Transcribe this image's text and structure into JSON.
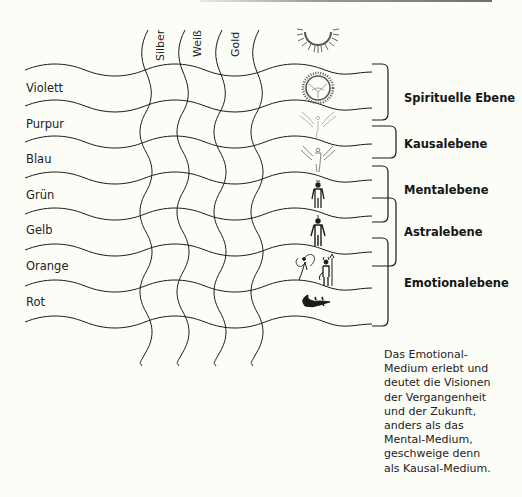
{
  "diagram": {
    "columns": [
      {
        "label": "Silber"
      },
      {
        "label": "Weiß"
      },
      {
        "label": "Gold"
      }
    ],
    "rows": [
      {
        "label": "Violett",
        "icon": "radiant-sun-with-dove-icon"
      },
      {
        "label": "Purpur",
        "icon": "winged-angel-faint-icon"
      },
      {
        "label": "Blau",
        "icon": "winged-angel-figure-icon"
      },
      {
        "label": "Grün",
        "icon": "human-figure-with-halo-icon"
      },
      {
        "label": "Gelb",
        "icon": "human-figure-icon"
      },
      {
        "label": "Orange",
        "icon": "fairy-and-devil-figures-icon"
      },
      {
        "label": "Rot",
        "icon": "lizard-icon"
      }
    ],
    "top_icon": "radiant-half-sun-icon",
    "planes": [
      {
        "label": "Spirituelle Ebene",
        "spans_rows": [
          "Violett",
          "Purpur"
        ]
      },
      {
        "label": "Kausalebene",
        "spans_rows": [
          "Blau"
        ]
      },
      {
        "label": "Mentalebene",
        "spans_rows": [
          "Grün",
          "Gelb"
        ]
      },
      {
        "label": "Astralebene",
        "spans_rows": [
          "Gelb",
          "Orange"
        ]
      },
      {
        "label": "Emotionalebene",
        "spans_rows": [
          "Orange",
          "Rot"
        ]
      }
    ],
    "caption_lines": [
      "Das Emotional-",
      "Medium erlebt und",
      "deutet die Visionen",
      "der Vergangenheit",
      "und der Zukunft,",
      "anders als das",
      "Mental-Medium,",
      "geschweige denn",
      "als Kausal-Medium."
    ]
  },
  "colors": {
    "background": "#fdfdf8",
    "lines": "#1a1a1a",
    "top_rule": "#7a7a76"
  }
}
